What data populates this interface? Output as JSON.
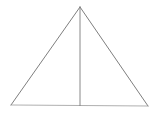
{
  "figure": {
    "background_color": "#ffffff",
    "canvas": {
      "width": 156,
      "height": 116
    },
    "stroke_colors": {
      "left_side": "#6f6f6f",
      "right_side": "#6f6f6f",
      "base": "#9a9a9a",
      "median": "#7a7a7a"
    },
    "stroke_widths": {
      "left_side": 0.9,
      "right_side": 0.9,
      "base": 0.8,
      "median": 0.9
    },
    "vertices": {
      "apex": {
        "label": "apex",
        "x": 80,
        "y": 7
      },
      "bottom_left": {
        "label": "bottom-left",
        "x": 11,
        "y": 105
      },
      "bottom_right": {
        "label": "bottom-right",
        "x": 148,
        "y": 106
      },
      "base_midpoint": {
        "label": "base-midpoint",
        "x": 80,
        "y": 105.5
      }
    },
    "edges": [
      {
        "name": "left-side",
        "from": "apex",
        "to": "bottom_left",
        "points": "80,7 11,105"
      },
      {
        "name": "right-side",
        "from": "apex",
        "to": "bottom_right",
        "points": "80,7 148,106"
      },
      {
        "name": "base",
        "from": "bottom_left",
        "to": "bottom_right",
        "points": "11,105 148,106"
      },
      {
        "name": "median",
        "from": "apex",
        "to": "base_midpoint",
        "points": "80,7 80,105.5"
      }
    ]
  }
}
